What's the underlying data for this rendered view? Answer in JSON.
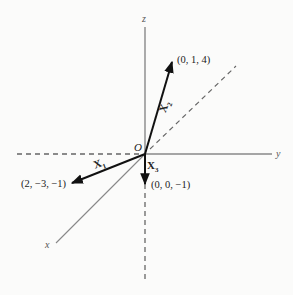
{
  "diagram": {
    "type": "3d-coordinate-vectors",
    "axes": {
      "x": {
        "label": "x"
      },
      "y": {
        "label": "y"
      },
      "z": {
        "label": "z"
      }
    },
    "origin": {
      "label": "O"
    },
    "vectors": [
      {
        "name": "X",
        "sub": "1",
        "point": "(2, −3, −1)"
      },
      {
        "name": "X",
        "sub": "2",
        "point": "(0, 1, 4)"
      },
      {
        "name": "X",
        "sub": "3",
        "point": "(0, 0, −1)"
      }
    ],
    "colors": {
      "axis": "#777777",
      "vector": "#111111",
      "background": "#fbfbfa"
    }
  }
}
